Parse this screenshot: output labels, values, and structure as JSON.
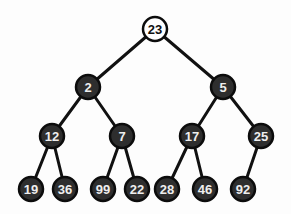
{
  "diagram": {
    "type": "binary-tree",
    "colors": {
      "root_fill": "#ffffff",
      "node_fill": "#2e2e2e",
      "edge": "#111111",
      "node_text": "#eeeeee",
      "root_text": "#111111"
    },
    "node_radius": 12,
    "nodes": [
      {
        "id": "n23",
        "label": "23",
        "x": 155,
        "y": 29,
        "style": "root"
      },
      {
        "id": "n2",
        "label": "2",
        "x": 88,
        "y": 87,
        "style": "dark"
      },
      {
        "id": "n5",
        "label": "5",
        "x": 223,
        "y": 87,
        "style": "dark"
      },
      {
        "id": "n12",
        "label": "12",
        "x": 52,
        "y": 136,
        "style": "dark"
      },
      {
        "id": "n7",
        "label": "7",
        "x": 122,
        "y": 136,
        "style": "dark"
      },
      {
        "id": "n17",
        "label": "17",
        "x": 192,
        "y": 136,
        "style": "dark"
      },
      {
        "id": "n25",
        "label": "25",
        "x": 261,
        "y": 136,
        "style": "dark"
      },
      {
        "id": "n19",
        "label": "19",
        "x": 31,
        "y": 189,
        "style": "dark"
      },
      {
        "id": "n36",
        "label": "36",
        "x": 65,
        "y": 189,
        "style": "dark"
      },
      {
        "id": "n99",
        "label": "99",
        "x": 103,
        "y": 189,
        "style": "dark"
      },
      {
        "id": "n22",
        "label": "22",
        "x": 137,
        "y": 189,
        "style": "dark"
      },
      {
        "id": "n28",
        "label": "28",
        "x": 167,
        "y": 189,
        "style": "dark"
      },
      {
        "id": "n46",
        "label": "46",
        "x": 205,
        "y": 189,
        "style": "dark"
      },
      {
        "id": "n92",
        "label": "92",
        "x": 243,
        "y": 189,
        "style": "dark"
      }
    ],
    "edges": [
      [
        "n23",
        "n2"
      ],
      [
        "n23",
        "n5"
      ],
      [
        "n2",
        "n12"
      ],
      [
        "n2",
        "n7"
      ],
      [
        "n5",
        "n17"
      ],
      [
        "n5",
        "n25"
      ],
      [
        "n12",
        "n19"
      ],
      [
        "n12",
        "n36"
      ],
      [
        "n7",
        "n99"
      ],
      [
        "n7",
        "n22"
      ],
      [
        "n17",
        "n28"
      ],
      [
        "n17",
        "n46"
      ],
      [
        "n25",
        "n92"
      ]
    ]
  }
}
